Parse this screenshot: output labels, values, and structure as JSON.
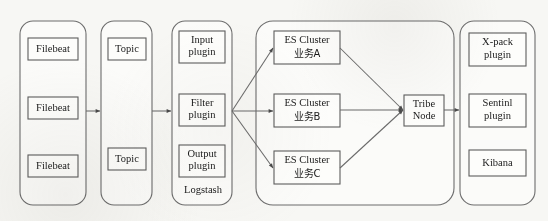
{
  "diagram": {
    "type": "flow-architecture",
    "background_color": "#f7f7f4",
    "stroke_color": "#6a6a6a",
    "box_fill": "#fdfdfb",
    "groups": [
      {
        "id": "beats",
        "caption": "",
        "nodes": [
          {
            "id": "filebeat-1",
            "label": "Filebeat"
          },
          {
            "id": "filebeat-2",
            "label": "Filebeat"
          },
          {
            "id": "filebeat-3",
            "label": "Filebeat"
          }
        ]
      },
      {
        "id": "kafka",
        "caption": "",
        "nodes": [
          {
            "id": "topic-1",
            "label": "Topic"
          },
          {
            "id": "topic-2",
            "label": "Topic"
          }
        ]
      },
      {
        "id": "logstash",
        "caption": "Logstash",
        "nodes": [
          {
            "id": "input-plugin",
            "line1": "Input",
            "line2": "plugin"
          },
          {
            "id": "filter-plugin",
            "line1": "Filter",
            "line2": "plugin"
          },
          {
            "id": "output-plugin",
            "line1": "Output",
            "line2": "plugin"
          }
        ]
      },
      {
        "id": "es-clusters",
        "caption": "",
        "nodes": [
          {
            "id": "es-cluster-a",
            "line1": "ES Cluster",
            "line2": "业务A"
          },
          {
            "id": "es-cluster-b",
            "line1": "ES Cluster",
            "line2": "业务B"
          },
          {
            "id": "es-cluster-c",
            "line1": "ES Cluster",
            "line2": "业务C"
          }
        ],
        "tribe": {
          "id": "tribe-node",
          "line1": "Tribe",
          "line2": "Node"
        }
      },
      {
        "id": "kibana-stack",
        "caption": "",
        "nodes": [
          {
            "id": "xpack-plugin",
            "line1": "X-pack",
            "line2": "plugin"
          },
          {
            "id": "sentinl-plugin",
            "line1": "Sentinl",
            "line2": "plugin"
          },
          {
            "id": "kibana",
            "line1": "Kibana",
            "line2": ""
          }
        ]
      }
    ],
    "connections": [
      {
        "from": "beats",
        "to": "kafka"
      },
      {
        "from": "kafka",
        "to": "logstash"
      },
      {
        "from": "logstash",
        "to": "es-cluster-a"
      },
      {
        "from": "logstash",
        "to": "es-cluster-b"
      },
      {
        "from": "logstash",
        "to": "es-cluster-c"
      },
      {
        "from": "es-cluster-a",
        "to": "tribe-node"
      },
      {
        "from": "es-cluster-b",
        "to": "tribe-node"
      },
      {
        "from": "es-cluster-c",
        "to": "tribe-node"
      },
      {
        "from": "tribe-node",
        "to": "kibana-stack"
      }
    ]
  }
}
